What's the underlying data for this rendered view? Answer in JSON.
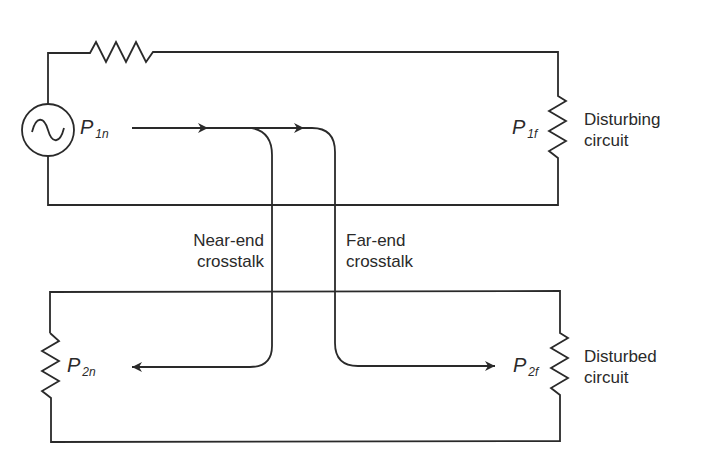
{
  "diagram": {
    "type": "circuit-crosstalk",
    "colors": {
      "line": "#2a2a2a",
      "background": "#ffffff"
    },
    "disturbing_circuit": {
      "label_line1": "Disturbing",
      "label_line2": "circuit",
      "source_icon": "ac-source",
      "near_power": {
        "symbol": "P",
        "subscript": "1n"
      },
      "far_power": {
        "symbol": "P",
        "subscript": "1f"
      }
    },
    "disturbed_circuit": {
      "label_line1": "Disturbed",
      "label_line2": "circuit",
      "near_power": {
        "symbol": "P",
        "subscript": "2n"
      },
      "far_power": {
        "symbol": "P",
        "subscript": "2f"
      }
    },
    "paths": {
      "near_end": {
        "label_line1": "Near-end",
        "label_line2": "crosstalk"
      },
      "far_end": {
        "label_line1": "Far-end",
        "label_line2": "crosstalk"
      }
    }
  }
}
